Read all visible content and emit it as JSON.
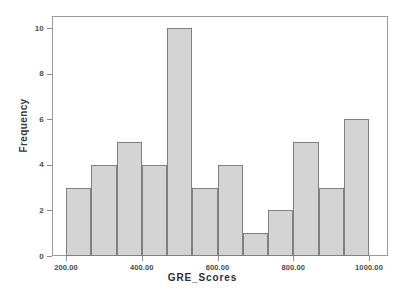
{
  "chart_data": {
    "type": "bar",
    "chart_style": "histogram",
    "title": "",
    "subtitle": "",
    "xlabel": "GRE_Scores",
    "ylabel": "Frequency",
    "xlim": [
      200,
      1000
    ],
    "ylim": [
      0,
      10
    ],
    "grid": false,
    "legend": null,
    "legend_position": "none",
    "bin_width": 66.67,
    "bin_count": 12,
    "bar_fill_color": "#d4d4d4",
    "bar_edge_color": "#808080",
    "frame_color": "#9a9a9a",
    "x_tick_labels": [
      "200.00",
      "400.00",
      "600.00",
      "800.00",
      "1000.00"
    ],
    "x_tick_values": [
      200,
      400,
      600,
      800,
      1000
    ],
    "y_tick_labels": [
      "0",
      "2",
      "4",
      "6",
      "8",
      "10"
    ],
    "y_tick_values": [
      0,
      2,
      4,
      6,
      8,
      10
    ],
    "categories": [
      "200.0-266.7",
      "266.7-333.3",
      "333.3-400.0",
      "400.0-466.7",
      "466.7-533.3",
      "533.3-600.0",
      "600.0-666.7",
      "666.7-733.3",
      "733.3-800.0",
      "800.0-866.7",
      "866.7-933.3",
      "933.3-1000.0"
    ],
    "bin_starts": [
      200,
      266.67,
      333.33,
      400,
      466.67,
      533.33,
      600,
      666.67,
      733.33,
      800,
      866.67,
      933.33
    ],
    "bin_ends": [
      266.67,
      333.33,
      400,
      466.67,
      533.33,
      600,
      666.67,
      733.33,
      800,
      866.67,
      933.33,
      1000
    ],
    "values": [
      3,
      4,
      5,
      4,
      10,
      3,
      4,
      1,
      2,
      5,
      3,
      6
    ],
    "total_count": 50
  }
}
